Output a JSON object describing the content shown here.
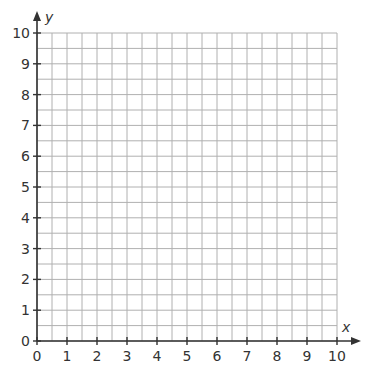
{
  "chart_data": {
    "type": "scatter",
    "title": "",
    "xlabel": "x",
    "ylabel": "y",
    "xlim": [
      0,
      10
    ],
    "ylim": [
      0,
      10
    ],
    "x_ticks": [
      0,
      1,
      2,
      3,
      4,
      5,
      6,
      7,
      8,
      9,
      10
    ],
    "y_ticks": [
      0,
      1,
      2,
      3,
      4,
      5,
      6,
      7,
      8,
      9,
      10
    ],
    "x_tick_labels": [
      "0",
      "1",
      "2",
      "3",
      "4",
      "5",
      "6",
      "7",
      "8",
      "9",
      "10"
    ],
    "y_tick_labels": [
      "0",
      "1",
      "2",
      "3",
      "4",
      "5",
      "6",
      "7",
      "8",
      "9",
      "10"
    ],
    "grid": true,
    "grid_step": 0.5,
    "series": [],
    "legend": null
  },
  "colors": {
    "grid": "#b0b0b0",
    "axis": "#333333",
    "background": "#ffffff"
  }
}
